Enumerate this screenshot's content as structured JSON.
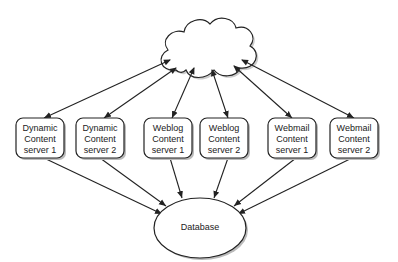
{
  "diagram": {
    "cloud": {
      "label": ""
    },
    "servers": [
      {
        "line1": "Dynamic",
        "line2": "Content",
        "line3": "server 1"
      },
      {
        "line1": "Dynamic",
        "line2": "Content",
        "line3": "server 2"
      },
      {
        "line1": "Weblog",
        "line2": "Content",
        "line3": "server 1"
      },
      {
        "line1": "Weblog",
        "line2": "Content",
        "line3": "server 2"
      },
      {
        "line1": "Webmail",
        "line2": "Content",
        "line3": "server 1"
      },
      {
        "line1": "Webmail",
        "line2": "Content",
        "line3": "server 2"
      }
    ],
    "database": {
      "label": "Database"
    },
    "colors": {
      "stroke": "#222222",
      "shadow": "#bbbbbb",
      "fill": "#ffffff"
    }
  }
}
